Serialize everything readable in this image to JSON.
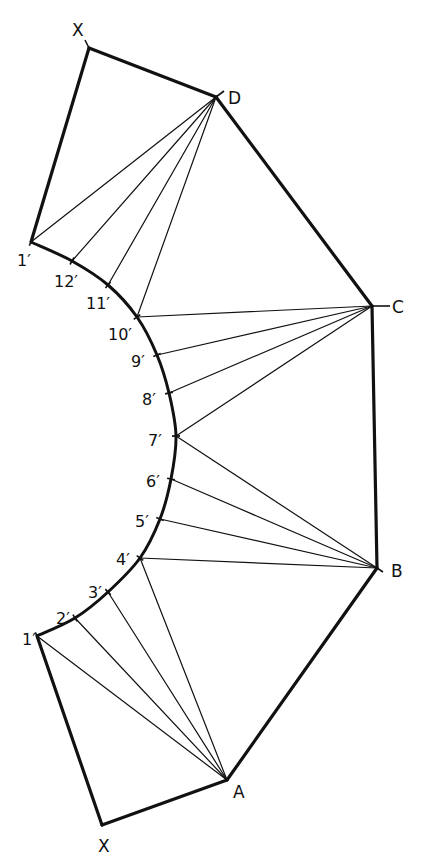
{
  "diagram": {
    "vertices": {
      "X_top": {
        "label": "X",
        "x": 89,
        "y": 48,
        "lx": 72,
        "ly": 36
      },
      "D": {
        "label": "D",
        "x": 216,
        "y": 97,
        "lx": 228,
        "ly": 104
      },
      "C": {
        "label": "C",
        "x": 372,
        "y": 306,
        "lx": 392,
        "ly": 313
      },
      "B": {
        "label": "B",
        "x": 377,
        "y": 568,
        "lx": 391,
        "ly": 577
      },
      "A": {
        "label": "A",
        "x": 227,
        "y": 780,
        "lx": 233,
        "ly": 798
      },
      "X_bottom": {
        "label": "X",
        "x": 102,
        "y": 825,
        "lx": 98,
        "ly": 852
      }
    },
    "arc_points": [
      {
        "label": "1′",
        "id": "1_top",
        "x": 31,
        "y": 242,
        "lx": 17,
        "ly": 266
      },
      {
        "label": "12′",
        "id": "12",
        "x": 72,
        "y": 261,
        "lx": 54,
        "ly": 287
      },
      {
        "label": "11′",
        "id": "11",
        "x": 108,
        "y": 285,
        "lx": 86,
        "ly": 309
      },
      {
        "label": "10′",
        "id": "10",
        "x": 137,
        "y": 317,
        "lx": 108,
        "ly": 340
      },
      {
        "label": "9′",
        "id": "9",
        "x": 157,
        "y": 355,
        "lx": 131,
        "ly": 367
      },
      {
        "label": "8′",
        "id": "8",
        "x": 169,
        "y": 393,
        "lx": 142,
        "ly": 405
      },
      {
        "label": "7′",
        "id": "7",
        "x": 176,
        "y": 436,
        "lx": 148,
        "ly": 446
      },
      {
        "label": "6′",
        "id": "6",
        "x": 171,
        "y": 479,
        "lx": 146,
        "ly": 487
      },
      {
        "label": "5′",
        "id": "5",
        "x": 160,
        "y": 519,
        "lx": 135,
        "ly": 527
      },
      {
        "label": "4′",
        "id": "4",
        "x": 140,
        "y": 558,
        "lx": 116,
        "ly": 565
      },
      {
        "label": "3′",
        "id": "3",
        "x": 108,
        "y": 592,
        "lx": 88,
        "ly": 598
      },
      {
        "label": "2′",
        "id": "2",
        "x": 75,
        "y": 618,
        "lx": 56,
        "ly": 624
      },
      {
        "label": "1′",
        "id": "1_bottom",
        "x": 37,
        "y": 636,
        "lx": 22,
        "ly": 645
      }
    ],
    "outline": [
      [
        "X_top",
        "D"
      ],
      [
        "D",
        "C"
      ],
      [
        "C",
        "B"
      ],
      [
        "B",
        "A"
      ],
      [
        "A",
        "X_bottom"
      ],
      [
        "X_bottom",
        "1_bottom"
      ],
      [
        "1_top",
        "X_top"
      ]
    ],
    "triangulation_lines": {
      "D": [
        "1_top",
        "12",
        "11",
        "10"
      ],
      "C": [
        "10",
        "9",
        "8",
        "7"
      ],
      "B": [
        "7",
        "6",
        "5",
        "4"
      ],
      "A": [
        "4",
        "3",
        "2",
        "1_bottom"
      ]
    },
    "line_color": "#111111",
    "background": "#ffffff"
  }
}
